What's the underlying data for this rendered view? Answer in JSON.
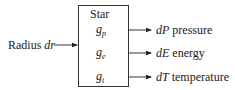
{
  "diagram": {
    "block": {
      "title": "Star",
      "functions": [
        {
          "base": "g",
          "sub": "p"
        },
        {
          "base": "g",
          "sub": "e"
        },
        {
          "base": "g",
          "sub": "t"
        }
      ]
    },
    "input": {
      "text": "Radius ",
      "var": "dr"
    },
    "outputs": [
      {
        "var": "dP",
        "text": " pressure"
      },
      {
        "var": "dE",
        "text": " energy"
      },
      {
        "var": "dT",
        "text": " temperature"
      }
    ]
  }
}
